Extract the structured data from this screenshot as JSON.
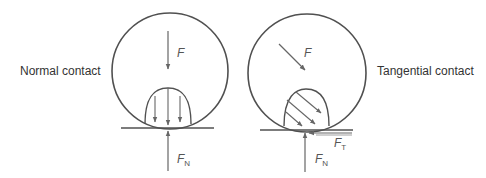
{
  "diagram": {
    "colors": {
      "background": "#ffffff",
      "outline": "#505050",
      "arrow": "#666666",
      "text": "#333333"
    },
    "left": {
      "title": "Normal contact",
      "force_label": "F",
      "normal_force_label": "F",
      "normal_force_subscript": "N"
    },
    "right": {
      "title": "Tangential contact",
      "force_label": "F",
      "normal_force_label": "F",
      "normal_force_subscript": "N",
      "tangential_force_label": "F",
      "tangential_force_subscript": "T"
    }
  }
}
